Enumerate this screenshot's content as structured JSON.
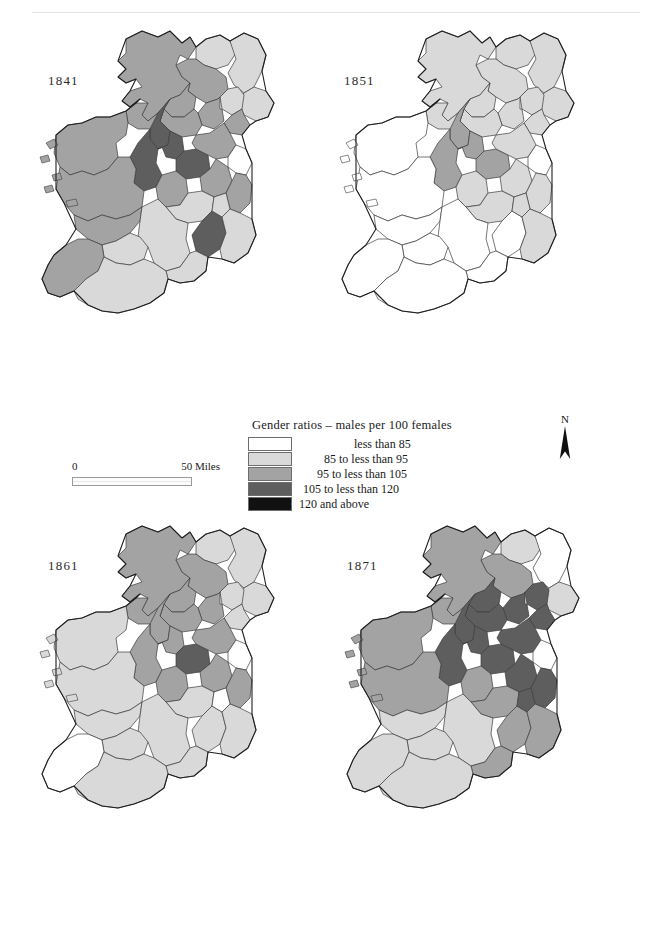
{
  "figure": {
    "kind": "choropleth-map-series",
    "region": "Ireland",
    "panels": [
      {
        "id": "1841",
        "year_label": "1841"
      },
      {
        "id": "1851",
        "year_label": "1851"
      },
      {
        "id": "1861",
        "year_label": "1861"
      },
      {
        "id": "1871",
        "year_label": "1871"
      }
    ]
  },
  "legend": {
    "title": "Gender ratios – males per 100 females",
    "classes": [
      {
        "label": "less than   85",
        "color": "#ffffff"
      },
      {
        "label": "85 to less than   95",
        "color": "#d9d9d9"
      },
      {
        "label": "95 to less than  105",
        "color": "#a3a3a3"
      },
      {
        "label": "105 to less than  120",
        "color": "#5e5e5e"
      },
      {
        "label": "120 and above",
        "color": "#111111"
      }
    ]
  },
  "scalebar": {
    "left_label": "0",
    "right_label": "50 Miles"
  },
  "north_arrow": {
    "label": "N"
  },
  "chart_data": {
    "type": "heatmap",
    "title": "Gender ratios – males per 100 females",
    "legend_position": "center",
    "class_breaks": [
      85,
      95,
      105,
      120
    ],
    "class_colors": [
      "#ffffff",
      "#d9d9d9",
      "#a3a3a3",
      "#5e5e5e",
      "#111111"
    ],
    "panels": [
      {
        "year": "1841",
        "counties": {
          "donegal": 2,
          "londonderry": 1,
          "antrim": 1,
          "tyrone": 2,
          "fermanagh": 2,
          "armagh": 1,
          "down": 1,
          "monaghan": 2,
          "cavan": 2,
          "louth": 2,
          "leitrim": 3,
          "sligo": 2,
          "mayo": 2,
          "roscommon": 3,
          "longford": 3,
          "westmeath": 3,
          "meath": 2,
          "dublin": 0,
          "galway": 2,
          "offaly": 2,
          "kildare": 2,
          "wicklow": 2,
          "clare": 2,
          "tipperary": 1,
          "laois": 1,
          "carlow": 1,
          "kilkenny": 3,
          "wexford": 1,
          "limerick": 1,
          "kerry": 2,
          "cork": 1,
          "waterford": 1
        }
      },
      {
        "year": "1851",
        "counties": {
          "donegal": 1,
          "londonderry": 1,
          "antrim": 1,
          "tyrone": 1,
          "fermanagh": 1,
          "armagh": 1,
          "down": 1,
          "monaghan": 1,
          "cavan": 1,
          "louth": 1,
          "leitrim": 2,
          "sligo": 1,
          "mayo": 0,
          "roscommon": 2,
          "longford": 2,
          "westmeath": 2,
          "meath": 1,
          "dublin": 0,
          "galway": 0,
          "offaly": 1,
          "kildare": 1,
          "wicklow": 1,
          "clare": 0,
          "tipperary": 0,
          "laois": 1,
          "carlow": 1,
          "kilkenny": 0,
          "wexford": 1,
          "limerick": 0,
          "kerry": 0,
          "cork": 0,
          "waterford": 0
        }
      },
      {
        "year": "1861",
        "counties": {
          "donegal": 2,
          "londonderry": 1,
          "antrim": 1,
          "tyrone": 2,
          "fermanagh": 2,
          "armagh": 1,
          "down": 1,
          "monaghan": 2,
          "cavan": 2,
          "louth": 1,
          "leitrim": 2,
          "sligo": 2,
          "mayo": 1,
          "roscommon": 2,
          "longford": 2,
          "westmeath": 3,
          "meath": 2,
          "dublin": 0,
          "galway": 1,
          "offaly": 2,
          "kildare": 2,
          "wicklow": 2,
          "clare": 1,
          "tipperary": 1,
          "laois": 1,
          "carlow": 0,
          "kilkenny": 1,
          "wexford": 1,
          "limerick": 1,
          "kerry": 0,
          "cork": 1,
          "waterford": 1
        }
      },
      {
        "year": "1871",
        "counties": {
          "donegal": 2,
          "londonderry": 1,
          "antrim": 0,
          "tyrone": 2,
          "fermanagh": 3,
          "armagh": 3,
          "down": 1,
          "monaghan": 3,
          "cavan": 3,
          "louth": 3,
          "leitrim": 3,
          "sligo": 2,
          "mayo": 2,
          "roscommon": 3,
          "longford": 3,
          "westmeath": 3,
          "meath": 3,
          "dublin": 0,
          "galway": 2,
          "offaly": 2,
          "kildare": 3,
          "wicklow": 3,
          "clare": 1,
          "tipperary": 1,
          "laois": 2,
          "carlow": 3,
          "kilkenny": 2,
          "wexford": 2,
          "limerick": 1,
          "kerry": 1,
          "cork": 1,
          "waterford": 2
        }
      }
    ]
  }
}
